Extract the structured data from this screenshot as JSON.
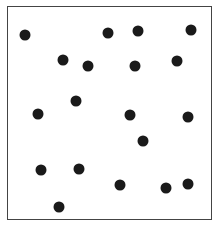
{
  "diagram": {
    "type": "point-distribution",
    "frame": {
      "left": 7,
      "top": 6,
      "right": 213,
      "bottom": 221,
      "border_color": "#444444"
    },
    "dot_color": "#1a1a1a",
    "dot_diameter": 11,
    "dots": [
      {
        "x": 25,
        "y": 35
      },
      {
        "x": 108,
        "y": 33
      },
      {
        "x": 138,
        "y": 31
      },
      {
        "x": 191,
        "y": 30
      },
      {
        "x": 63,
        "y": 60
      },
      {
        "x": 88,
        "y": 66
      },
      {
        "x": 135,
        "y": 66
      },
      {
        "x": 177,
        "y": 61
      },
      {
        "x": 76,
        "y": 101
      },
      {
        "x": 38,
        "y": 114
      },
      {
        "x": 130,
        "y": 115
      },
      {
        "x": 188,
        "y": 117
      },
      {
        "x": 143,
        "y": 141
      },
      {
        "x": 41,
        "y": 170
      },
      {
        "x": 79,
        "y": 169
      },
      {
        "x": 120,
        "y": 185
      },
      {
        "x": 166,
        "y": 188
      },
      {
        "x": 188,
        "y": 184
      },
      {
        "x": 59,
        "y": 207
      }
    ]
  }
}
